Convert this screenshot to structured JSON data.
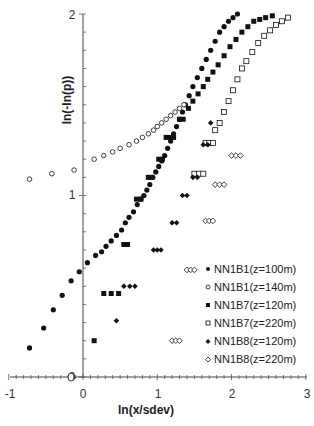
{
  "chart_data": {
    "type": "scatter",
    "title": "",
    "xlabel": "ln(x/sdev)",
    "ylabel": "ln(-ln(p))",
    "xlim": [
      -1,
      3
    ],
    "ylim": [
      0,
      2
    ],
    "x_ticks": [
      "-1",
      "0",
      "1",
      "2",
      "3"
    ],
    "y_ticks": [
      "0",
      "1",
      "2"
    ],
    "x_minor_step": 0.1,
    "y_minor_step": 0.1,
    "grid": false,
    "legend_position": "lower right inside",
    "series": [
      {
        "name": "NN1B1(z=100m)",
        "marker": "filled-circle",
        "points": [
          [
            -0.72,
            0.16
          ],
          [
            -0.53,
            0.27
          ],
          [
            -0.4,
            0.37
          ],
          [
            -0.28,
            0.45
          ],
          [
            -0.16,
            0.53
          ],
          [
            -0.05,
            0.58
          ],
          [
            0.06,
            0.63
          ],
          [
            0.17,
            0.67
          ],
          [
            0.25,
            0.69
          ],
          [
            0.31,
            0.72
          ],
          [
            0.38,
            0.75
          ],
          [
            0.45,
            0.78
          ],
          [
            0.52,
            0.81
          ],
          [
            0.57,
            0.85
          ],
          [
            0.62,
            0.88
          ],
          [
            0.68,
            0.91
          ],
          [
            0.73,
            0.95
          ],
          [
            0.78,
            0.98
          ],
          [
            0.82,
            1.0
          ],
          [
            0.86,
            1.03
          ],
          [
            0.9,
            1.06
          ],
          [
            0.94,
            1.1
          ],
          [
            0.98,
            1.13
          ],
          [
            1.02,
            1.16
          ],
          [
            1.06,
            1.19
          ],
          [
            1.1,
            1.22
          ],
          [
            1.14,
            1.26
          ],
          [
            1.18,
            1.3
          ],
          [
            1.22,
            1.34
          ],
          [
            1.26,
            1.38
          ],
          [
            1.3,
            1.42
          ],
          [
            1.34,
            1.46
          ],
          [
            1.38,
            1.5
          ],
          [
            1.43,
            1.55
          ],
          [
            1.48,
            1.6
          ],
          [
            1.54,
            1.65
          ],
          [
            1.6,
            1.7
          ],
          [
            1.66,
            1.75
          ],
          [
            1.72,
            1.8
          ],
          [
            1.78,
            1.85
          ],
          [
            1.84,
            1.9
          ],
          [
            1.9,
            1.93
          ],
          [
            1.96,
            1.96
          ],
          [
            2.02,
            1.98
          ],
          [
            2.08,
            2.0
          ]
        ]
      },
      {
        "name": "NN1B1(z=140m)",
        "marker": "open-circle",
        "points": [
          [
            -0.72,
            1.09
          ],
          [
            -0.42,
            1.12
          ],
          [
            -0.12,
            1.14
          ],
          [
            0.15,
            1.2
          ],
          [
            0.28,
            1.22
          ],
          [
            0.4,
            1.24
          ],
          [
            0.5,
            1.26
          ],
          [
            0.62,
            1.28
          ],
          [
            0.72,
            1.3
          ],
          [
            0.8,
            1.32
          ],
          [
            0.88,
            1.34
          ],
          [
            0.95,
            1.36
          ],
          [
            1.0,
            1.38
          ],
          [
            1.06,
            1.4
          ],
          [
            1.12,
            1.42
          ],
          [
            1.18,
            1.44
          ],
          [
            1.24,
            1.46
          ],
          [
            1.3,
            1.48
          ],
          [
            1.36,
            1.5
          ]
        ]
      },
      {
        "name": "NN1B7(z=120m)",
        "marker": "filled-square",
        "points": [
          [
            0.15,
            0.2
          ],
          [
            0.28,
            0.46
          ],
          [
            0.38,
            0.46
          ],
          [
            0.48,
            0.46
          ],
          [
            0.55,
            0.73
          ],
          [
            0.6,
            0.73
          ],
          [
            0.72,
            0.98
          ],
          [
            0.78,
            0.98
          ],
          [
            0.88,
            1.1
          ],
          [
            0.92,
            1.1
          ],
          [
            1.02,
            1.2
          ],
          [
            1.07,
            1.2
          ],
          [
            1.12,
            1.32
          ],
          [
            1.17,
            1.32
          ],
          [
            1.22,
            1.32
          ],
          [
            1.3,
            1.42
          ],
          [
            1.35,
            1.42
          ],
          [
            1.42,
            1.48
          ],
          [
            1.48,
            1.52
          ],
          [
            1.55,
            1.56
          ],
          [
            1.62,
            1.6
          ],
          [
            1.68,
            1.64
          ],
          [
            1.75,
            1.68
          ],
          [
            1.82,
            1.72
          ],
          [
            1.9,
            1.77
          ],
          [
            1.98,
            1.82
          ],
          [
            2.06,
            1.86
          ],
          [
            2.14,
            1.9
          ],
          [
            2.22,
            1.93
          ],
          [
            2.3,
            1.96
          ],
          [
            2.38,
            1.97
          ],
          [
            2.46,
            1.98
          ],
          [
            2.55,
            1.99
          ]
        ]
      },
      {
        "name": "NN1B7(z=220m)",
        "marker": "open-square",
        "points": [
          [
            1.5,
            1.12
          ],
          [
            1.56,
            1.12
          ],
          [
            1.62,
            1.12
          ],
          [
            1.65,
            1.29
          ],
          [
            1.7,
            1.29
          ],
          [
            1.75,
            1.29
          ],
          [
            1.78,
            1.36
          ],
          [
            1.84,
            1.4
          ],
          [
            1.9,
            1.46
          ],
          [
            1.96,
            1.52
          ],
          [
            2.02,
            1.58
          ],
          [
            2.08,
            1.64
          ],
          [
            2.14,
            1.7
          ],
          [
            2.2,
            1.74
          ],
          [
            2.28,
            1.79
          ],
          [
            2.36,
            1.84
          ],
          [
            2.44,
            1.88
          ],
          [
            2.52,
            1.91
          ],
          [
            2.6,
            1.94
          ],
          [
            2.68,
            1.96
          ],
          [
            2.76,
            1.98
          ]
        ]
      },
      {
        "name": "NN1B8(z=120m)",
        "marker": "filled-diamond",
        "points": [
          [
            0.45,
            0.31
          ],
          [
            0.55,
            0.5
          ],
          [
            0.63,
            0.5
          ],
          [
            0.7,
            0.5
          ],
          [
            0.95,
            0.7
          ],
          [
            1.0,
            0.7
          ],
          [
            1.05,
            0.7
          ],
          [
            1.2,
            0.85
          ],
          [
            1.26,
            0.85
          ],
          [
            1.34,
            1.0
          ],
          [
            1.4,
            1.0
          ],
          [
            1.48,
            1.1
          ],
          [
            1.54,
            1.1
          ],
          [
            1.62,
            1.28
          ],
          [
            1.68,
            1.28
          ],
          [
            1.72,
            1.4
          ]
        ]
      },
      {
        "name": "NN1B8(z=220m)",
        "marker": "open-diamond",
        "points": [
          [
            1.2,
            0.2
          ],
          [
            1.25,
            0.2
          ],
          [
            1.3,
            0.2
          ],
          [
            1.4,
            0.59
          ],
          [
            1.45,
            0.59
          ],
          [
            1.5,
            0.59
          ],
          [
            1.65,
            0.86
          ],
          [
            1.7,
            0.86
          ],
          [
            1.75,
            0.86
          ],
          [
            1.78,
            1.06
          ],
          [
            1.84,
            1.06
          ],
          [
            1.9,
            1.06
          ],
          [
            2.0,
            1.22
          ],
          [
            2.06,
            1.22
          ],
          [
            2.12,
            1.22
          ]
        ]
      }
    ],
    "annotations": [
      "0 (small circle marker near origin on x-axis)"
    ]
  },
  "legend": {
    "items": [
      {
        "label": "NN1B1(z=100m)",
        "marker": "filled-circle"
      },
      {
        "label": "NN1B1(z=140m)",
        "marker": "open-circle"
      },
      {
        "label": "NN1B7(z=120m)",
        "marker": "filled-square"
      },
      {
        "label": "NN1B7(z=220m)",
        "marker": "open-square"
      },
      {
        "label": "NN1B8(z=120m)",
        "marker": "filled-diamond"
      },
      {
        "label": "NN1B8(z=220m)",
        "marker": "open-diamond"
      }
    ]
  },
  "axes": {
    "x_title": "ln(x/sdev)",
    "y_title": "ln(-ln(p))",
    "x_tick_labels": [
      "-1",
      "0",
      "1",
      "2",
      "3"
    ],
    "y_tick_labels": [
      "0",
      "1",
      "2"
    ]
  }
}
